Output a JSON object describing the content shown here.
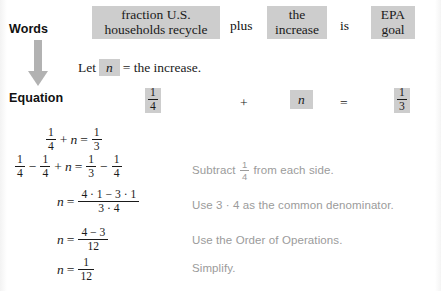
{
  "rail": {
    "words_label": "Words",
    "equation_label": "Equation",
    "arrow_icon": "down-arrow-icon",
    "arrow_color": "#b0b0b0"
  },
  "colors": {
    "highlight": "#cdcdcd",
    "note_text": "#9b9b9b",
    "body_text": "#1a1a1a"
  },
  "words_row": {
    "phrase_1": "fraction U.S. households recycle",
    "phrase_1_line_1": "fraction U.S.",
    "phrase_1_line_2": "households recycle",
    "connector_1": "plus",
    "phrase_2": "the increase",
    "phrase_2_line_1": "the",
    "phrase_2_line_2": "increase",
    "connector_2": "is",
    "phrase_3": "EPA goal",
    "phrase_3_line_1": "EPA",
    "phrase_3_line_2": "goal"
  },
  "let_statement": {
    "lead": "Let",
    "variable": "n",
    "rest": "= the increase."
  },
  "equation_row": {
    "left_fraction": {
      "numerator": "1",
      "denominator": "4"
    },
    "operator_1": "+",
    "variable": "n",
    "operator_2": "=",
    "right_fraction": {
      "numerator": "1",
      "denominator": "3"
    }
  },
  "steps": [
    {
      "id": "step-1",
      "equation_text": "1/4 + n = 1/3",
      "note": ""
    },
    {
      "id": "step-2",
      "equation_text": "1/4 - 1/4 + n = 1/3 - 1/4",
      "note_prefix": "Subtract",
      "note_fraction": {
        "numerator": "1",
        "denominator": "4"
      },
      "note_suffix": "from each side."
    },
    {
      "id": "step-3",
      "equation_text": "n = (4 · 1 - 3 · 1) / (3 · 4)",
      "numerator": "4 · 1 − 3 · 1",
      "denominator": "3 · 4",
      "note": "Use 3 · 4 as the common denominator."
    },
    {
      "id": "step-4",
      "equation_text": "n = (4 - 3) / 12",
      "numerator": "4 − 3",
      "denominator": "12",
      "note": "Use the Order of Operations."
    },
    {
      "id": "step-5",
      "equation_text": "n = 1/12",
      "numerator": "1",
      "denominator": "12",
      "note": "Simplify."
    }
  ],
  "symbols": {
    "plus": "+",
    "minus": "−",
    "equals": "=",
    "variable_n": "n",
    "one": "1",
    "three": "3",
    "four": "4",
    "twelve": "12"
  }
}
